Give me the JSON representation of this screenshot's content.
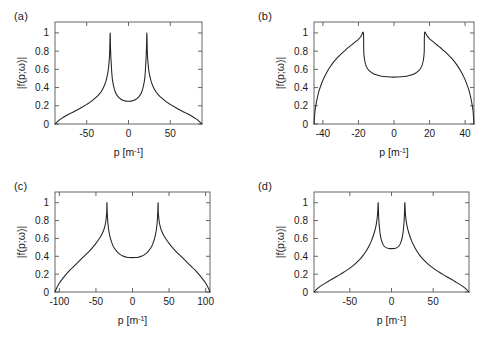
{
  "figure": {
    "background": "#ffffff",
    "line_color": "#222222",
    "axis_color": "#555555",
    "panels": [
      "a",
      "b",
      "c",
      "d"
    ]
  },
  "panel_labels": {
    "a": "(a)",
    "b": "(b)",
    "c": "(c)",
    "d": "(d)"
  },
  "axis_titles": {
    "x_main": "p [m",
    "x_sup": "-1",
    "x_close": "]",
    "y": "|f(p;ω)|"
  },
  "chart_data": [
    {
      "id": "a",
      "type": "line",
      "title": "(a)",
      "xlabel": "p [m^-1]",
      "ylabel": "|f(p;ω)|",
      "xlim": [
        -88,
        88
      ],
      "ylim": [
        0,
        1.12
      ],
      "xticks": [
        -50,
        0,
        50
      ],
      "xticklabels": [
        "-50",
        "0",
        "50"
      ],
      "yticks": [
        0,
        0.2,
        0.4,
        0.6,
        0.8,
        1
      ],
      "yticklabels": [
        "0",
        "0.2",
        "0.4",
        "0.6",
        "0.8",
        "1"
      ],
      "grid": false,
      "legend": null,
      "peak_positions": [
        -22,
        22
      ],
      "peak_value": 1.0,
      "center_min": 0.25,
      "edge_value": 0.0,
      "x": [
        -88,
        -84,
        -80,
        -75,
        -70,
        -65,
        -60,
        -55,
        -50,
        -45,
        -40,
        -36,
        -32,
        -29,
        -27,
        -25,
        -24,
        -23,
        -22.5,
        -22,
        -21.5,
        -21,
        -20,
        -19,
        -17,
        -15,
        -12,
        -9,
        -6,
        -3,
        0,
        3,
        6,
        9,
        12,
        15,
        17,
        19,
        20,
        21,
        21.5,
        22,
        22.5,
        23,
        24,
        25,
        27,
        29,
        32,
        36,
        40,
        45,
        50,
        55,
        60,
        65,
        70,
        75,
        80,
        84,
        88
      ],
      "y": [
        0.0,
        0.035,
        0.062,
        0.09,
        0.115,
        0.138,
        0.162,
        0.188,
        0.215,
        0.245,
        0.283,
        0.318,
        0.365,
        0.42,
        0.47,
        0.55,
        0.61,
        0.71,
        0.8,
        1.0,
        0.83,
        0.72,
        0.56,
        0.47,
        0.385,
        0.335,
        0.295,
        0.272,
        0.258,
        0.251,
        0.249,
        0.251,
        0.258,
        0.272,
        0.295,
        0.335,
        0.385,
        0.47,
        0.56,
        0.72,
        0.83,
        1.0,
        0.8,
        0.71,
        0.61,
        0.55,
        0.47,
        0.42,
        0.365,
        0.318,
        0.283,
        0.245,
        0.215,
        0.188,
        0.162,
        0.138,
        0.115,
        0.09,
        0.062,
        0.035,
        0.0
      ]
    },
    {
      "id": "b",
      "type": "line",
      "title": "(b)",
      "xlabel": "p [m^-1]",
      "ylabel": "|f(p;ω)|",
      "xlim": [
        -45,
        45
      ],
      "ylim": [
        0,
        1.12
      ],
      "xticks": [
        -40,
        -20,
        0,
        20,
        40
      ],
      "xticklabels": [
        "-40",
        "-20",
        "0",
        "20",
        "40"
      ],
      "yticks": [
        0,
        0.2,
        0.4,
        0.6,
        0.8,
        1
      ],
      "yticklabels": [
        "0",
        "0.2",
        "0.4",
        "0.6",
        "0.8",
        "1"
      ],
      "grid": false,
      "legend": null,
      "peak_positions": [
        -17,
        17
      ],
      "peak_value": 1.01,
      "center_min": 0.52,
      "edge_value": 0.0,
      "x": [
        -45,
        -44.5,
        -44,
        -43,
        -42,
        -40,
        -38,
        -36,
        -34,
        -32,
        -30,
        -28,
        -26,
        -24,
        -22,
        -20,
        -18.5,
        -17.2,
        -17.0,
        -16.5,
        -15.5,
        -14,
        -12,
        -10,
        -7,
        -4,
        0,
        4,
        7,
        10,
        12,
        14,
        15.5,
        16.5,
        17.0,
        17.2,
        18.5,
        20,
        22,
        24,
        26,
        28,
        30,
        32,
        34,
        36,
        38,
        40,
        42,
        43,
        44,
        44.5,
        45
      ],
      "y": [
        0.0,
        0.13,
        0.2,
        0.3,
        0.375,
        0.48,
        0.56,
        0.625,
        0.68,
        0.725,
        0.765,
        0.8,
        0.835,
        0.865,
        0.9,
        0.93,
        0.965,
        1.0,
        0.79,
        0.7,
        0.63,
        0.585,
        0.558,
        0.54,
        0.525,
        0.518,
        0.515,
        0.518,
        0.525,
        0.54,
        0.558,
        0.585,
        0.63,
        0.7,
        0.79,
        1.0,
        0.97,
        0.935,
        0.905,
        0.87,
        0.84,
        0.805,
        0.77,
        0.73,
        0.685,
        0.63,
        0.565,
        0.485,
        0.38,
        0.305,
        0.205,
        0.135,
        0.0
      ]
    },
    {
      "id": "c",
      "type": "line",
      "title": "(c)",
      "xlabel": "p [m^-1]",
      "ylabel": "|f(p;ω)|",
      "xlim": [
        -106,
        106
      ],
      "ylim": [
        0,
        1.12
      ],
      "xticks": [
        -100,
        -50,
        0,
        50,
        100
      ],
      "xticklabels": [
        "-100",
        "-50",
        "0",
        "50",
        "100"
      ],
      "yticks": [
        0,
        0.2,
        0.4,
        0.6,
        0.8,
        1
      ],
      "yticklabels": [
        "0",
        "0.2",
        "0.4",
        "0.6",
        "0.8",
        "1"
      ],
      "grid": false,
      "legend": null,
      "peak_positions": [
        -35,
        35
      ],
      "peak_value": 1.0,
      "center_min": 0.385,
      "edge_value": 0.0,
      "x": [
        -106,
        -104,
        -100,
        -95,
        -90,
        -85,
        -80,
        -75,
        -70,
        -65,
        -60,
        -55,
        -50,
        -46,
        -43,
        -40,
        -38,
        -36.5,
        -35.3,
        -35.0,
        -34.2,
        -33,
        -31,
        -28,
        -25,
        -21,
        -17,
        -13,
        -8,
        -4,
        0,
        4,
        8,
        13,
        17,
        21,
        25,
        28,
        31,
        33,
        34.2,
        35.0,
        35.3,
        36.5,
        38,
        40,
        43,
        46,
        50,
        55,
        60,
        65,
        70,
        75,
        80,
        85,
        90,
        95,
        100,
        104,
        106
      ],
      "y": [
        0.0,
        0.04,
        0.1,
        0.155,
        0.205,
        0.25,
        0.29,
        0.33,
        0.37,
        0.41,
        0.45,
        0.495,
        0.545,
        0.59,
        0.63,
        0.68,
        0.73,
        0.79,
        0.89,
        1.0,
        0.83,
        0.72,
        0.625,
        0.545,
        0.492,
        0.45,
        0.422,
        0.403,
        0.39,
        0.386,
        0.385,
        0.386,
        0.39,
        0.403,
        0.422,
        0.45,
        0.492,
        0.545,
        0.625,
        0.72,
        0.83,
        1.0,
        0.89,
        0.79,
        0.73,
        0.68,
        0.63,
        0.59,
        0.545,
        0.495,
        0.45,
        0.41,
        0.37,
        0.33,
        0.29,
        0.25,
        0.205,
        0.155,
        0.1,
        0.04,
        0.0
      ]
    },
    {
      "id": "d",
      "type": "line",
      "title": "(d)",
      "xlabel": "p [m^-1]",
      "ylabel": "|f(p;ω)|",
      "xlim": [
        -93,
        93
      ],
      "ylim": [
        0,
        1.12
      ],
      "xticks": [
        -50,
        0,
        50
      ],
      "xticklabels": [
        "-50",
        "0",
        "50"
      ],
      "yticks": [
        0,
        0.2,
        0.4,
        0.6,
        0.8,
        1
      ],
      "yticklabels": [
        "0",
        "0.2",
        "0.4",
        "0.6",
        "0.8",
        "1"
      ],
      "grid": false,
      "legend": null,
      "peak_positions": [
        -16,
        16
      ],
      "peak_value": 1.0,
      "center_min": 0.485,
      "edge_value": 0.0,
      "x": [
        -93,
        -90,
        -86,
        -82,
        -78,
        -74,
        -70,
        -66,
        -62,
        -58,
        -54,
        -50,
        -46,
        -42,
        -38,
        -34,
        -30,
        -27,
        -24,
        -21,
        -19,
        -17.5,
        -16.6,
        -16.0,
        -15.4,
        -14.5,
        -13,
        -11,
        -9,
        -6,
        -3,
        0,
        3,
        6,
        9,
        11,
        13,
        14.5,
        15.4,
        16.0,
        16.6,
        17.5,
        19,
        21,
        24,
        27,
        30,
        34,
        38,
        42,
        46,
        50,
        54,
        58,
        62,
        66,
        70,
        74,
        78,
        82,
        86,
        90,
        93
      ],
      "y": [
        0.0,
        0.03,
        0.06,
        0.085,
        0.108,
        0.13,
        0.152,
        0.173,
        0.195,
        0.218,
        0.242,
        0.268,
        0.296,
        0.328,
        0.365,
        0.41,
        0.465,
        0.515,
        0.575,
        0.655,
        0.725,
        0.805,
        0.89,
        1.0,
        0.84,
        0.72,
        0.615,
        0.55,
        0.515,
        0.494,
        0.487,
        0.486,
        0.487,
        0.494,
        0.515,
        0.55,
        0.615,
        0.72,
        0.84,
        1.0,
        0.89,
        0.805,
        0.725,
        0.655,
        0.575,
        0.515,
        0.465,
        0.41,
        0.365,
        0.328,
        0.296,
        0.268,
        0.242,
        0.218,
        0.195,
        0.173,
        0.152,
        0.13,
        0.108,
        0.085,
        0.06,
        0.03,
        0.0
      ]
    }
  ]
}
